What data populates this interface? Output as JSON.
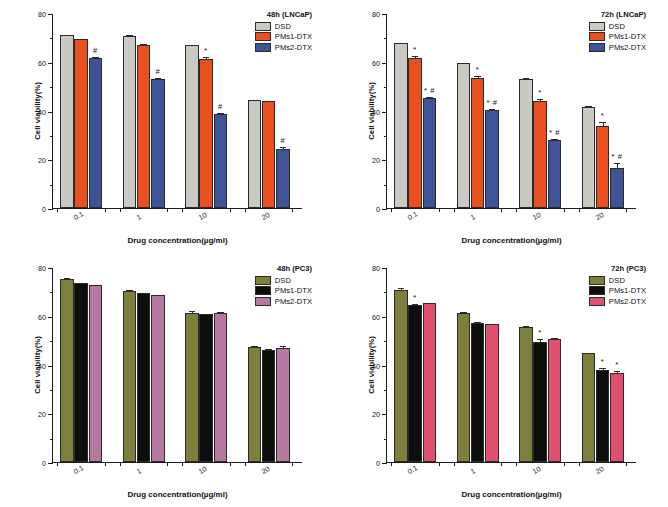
{
  "figure": {
    "axis_title_y": "Cell viability(%)",
    "axis_title_x": "Drug concentration(µg/ml)",
    "y_ticks": [
      "0",
      "20",
      "40",
      "60",
      "80"
    ],
    "x_ticks": [
      "0.1",
      "1",
      "10",
      "20"
    ]
  },
  "chart_data": [
    {
      "type": "bar",
      "panel": "A",
      "title": "48h (LNCaP)",
      "xlabel": "Drug concentration(µg/ml)",
      "ylabel": "Cell viability(%)",
      "ylim": [
        0,
        80
      ],
      "categories": [
        "0.1",
        "1",
        "10",
        "20"
      ],
      "grid": false,
      "legend_position": "top-right",
      "colors": [
        "#cac9c4",
        "#e8511f",
        "#3e5496"
      ],
      "series": [
        {
          "name": "DSD",
          "color": "#cac9c4",
          "values": [
            71.0,
            70.7,
            66.8,
            44.4
          ],
          "errors": [
            0.5,
            0.7,
            0.6,
            0.5
          ],
          "sig": [
            "",
            "",
            "",
            ""
          ]
        },
        {
          "name": "PMs1-DTX",
          "color": "#e8511f",
          "values": [
            69.3,
            66.9,
            61.0,
            43.7
          ],
          "errors": [
            0.4,
            0.9,
            1.2,
            0.5
          ],
          "sig": [
            "",
            "",
            "*",
            ""
          ]
        },
        {
          "name": "PMs2-DTX",
          "color": "#3e5496",
          "values": [
            61.4,
            52.9,
            38.6,
            24.4
          ],
          "errors": [
            1.0,
            0.8,
            0.9,
            1.0
          ],
          "sig": [
            "#",
            "#",
            "#",
            "#"
          ]
        }
      ]
    },
    {
      "type": "bar",
      "panel": "B",
      "title": "72h (LNCaP)",
      "xlabel": "Drug concentration(µg/ml)",
      "ylabel": "Cell viability(%)",
      "ylim": [
        0,
        80
      ],
      "categories": [
        "0.1",
        "1",
        "10",
        "20"
      ],
      "grid": false,
      "legend_position": "top-right",
      "colors": [
        "#cac9c4",
        "#e8511f",
        "#3e5496"
      ],
      "series": [
        {
          "name": "DSD",
          "color": "#cac9c4",
          "values": [
            67.5,
            59.4,
            53.1,
            41.6
          ],
          "errors": [
            0.4,
            0.5,
            0.6,
            0.5
          ],
          "sig": [
            "",
            "",
            "",
            ""
          ]
        },
        {
          "name": "PMs1-DTX",
          "color": "#e8511f",
          "values": [
            61.7,
            53.2,
            43.7,
            33.6
          ],
          "errors": [
            1.1,
            1.2,
            1.6,
            2.1
          ],
          "sig": [
            "*",
            "*",
            "*",
            "*"
          ]
        },
        {
          "name": "PMs2-DTX",
          "color": "#3e5496",
          "values": [
            45.0,
            40.2,
            28.1,
            16.4
          ],
          "errors": [
            1.1,
            1.0,
            0.7,
            2.4
          ],
          "sig": [
            "* #",
            "* #",
            "* #",
            "* #"
          ]
        }
      ]
    },
    {
      "type": "bar",
      "panel": "C",
      "title": "48h (PC3)",
      "xlabel": "Drug concentration(µg/ml)",
      "ylabel": "Cell viability(%)",
      "ylim": [
        0,
        80
      ],
      "categories": [
        "0.1",
        "1",
        "10",
        "20"
      ],
      "grid": false,
      "legend_position": "top-right",
      "colors": [
        "#7d7f3d",
        "#0d0d0d",
        "#b578a0"
      ],
      "series": [
        {
          "name": "DSD",
          "color": "#7d7f3d",
          "values": [
            75.0,
            70.0,
            61.3,
            47.2
          ],
          "errors": [
            0.9,
            0.9,
            0.9,
            0.7
          ],
          "sig": [
            "",
            "",
            "",
            ""
          ]
        },
        {
          "name": "PMs1-DTX",
          "color": "#0d0d0d",
          "values": [
            73.3,
            69.2,
            60.7,
            45.9
          ],
          "errors": [
            0.4,
            0.6,
            0.5,
            0.7
          ],
          "sig": [
            "",
            "",
            "",
            ""
          ]
        },
        {
          "name": "PMs2-DTX",
          "color": "#b578a0",
          "values": [
            72.6,
            68.5,
            61.1,
            46.8
          ],
          "errors": [
            0.4,
            0.5,
            0.9,
            1.0
          ],
          "sig": [
            "",
            "",
            "",
            ""
          ]
        }
      ]
    },
    {
      "type": "bar",
      "panel": "D",
      "title": "72h (PC3)",
      "xlabel": "Drug concentration(µg/ml)",
      "ylabel": "Cell viability(%)",
      "ylim": [
        0,
        80
      ],
      "categories": [
        "0.1",
        "1",
        "10",
        "20"
      ],
      "grid": false,
      "legend_position": "top-right",
      "colors": [
        "#7d7f3d",
        "#0d0d0d",
        "#e0506e"
      ],
      "series": [
        {
          "name": "DSD",
          "color": "#7d7f3d",
          "values": [
            70.5,
            61.2,
            55.2,
            44.6
          ],
          "errors": [
            1.5,
            0.7,
            1.2,
            0.6
          ],
          "sig": [
            "",
            "",
            "",
            ""
          ]
        },
        {
          "name": "PMs1-DTX",
          "color": "#0d0d0d",
          "values": [
            64.5,
            57.2,
            49.3,
            37.8
          ],
          "errors": [
            0.7,
            0.6,
            1.4,
            1.3
          ],
          "sig": [
            "*",
            "",
            "*",
            "*"
          ]
        },
        {
          "name": "PMs2-DTX",
          "color": "#e0506e",
          "values": [
            65.1,
            56.7,
            50.3,
            36.7
          ],
          "errors": [
            0.5,
            0.5,
            1.1,
            0.9
          ],
          "sig": [
            "",
            "",
            "",
            "*"
          ]
        }
      ]
    }
  ]
}
